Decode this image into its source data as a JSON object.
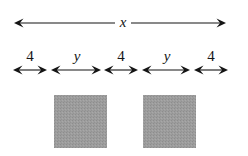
{
  "figure": {
    "canvas": {
      "width": 248,
      "height": 156,
      "background": "#ffffff"
    },
    "colors": {
      "ink": "#151515",
      "shade_fill": "#9a9a9a",
      "background": "#ffffff"
    },
    "overall_dimension": {
      "label": "x",
      "style": "italic",
      "arrow": "double-headed",
      "y": 23,
      "x_start": 14,
      "x_end": 226,
      "label_x": 123,
      "label_y": 27
    },
    "segments": [
      {
        "label": "4",
        "style": "upright",
        "x_start": 13,
        "x_end": 47,
        "label_x": 30,
        "label_y": 61,
        "arrow_y": 70,
        "shaded": false
      },
      {
        "label": "y",
        "style": "italic",
        "x_start": 51,
        "x_end": 101,
        "label_x": 77,
        "label_y": 61,
        "arrow_y": 70,
        "shaded": true
      },
      {
        "label": "4",
        "style": "upright",
        "x_start": 104,
        "x_end": 138,
        "label_x": 121,
        "label_y": 61,
        "arrow_y": 70,
        "shaded": false
      },
      {
        "label": "y",
        "style": "italic",
        "x_start": 142,
        "x_end": 190,
        "label_x": 167,
        "label_y": 61,
        "arrow_y": 70,
        "shaded": true
      },
      {
        "label": "4",
        "style": "upright",
        "x_start": 194,
        "x_end": 228,
        "label_x": 211,
        "label_y": 61,
        "arrow_y": 70,
        "shaded": false
      }
    ],
    "shaded_squares": [
      {
        "x": 54,
        "y": 95,
        "width": 53,
        "height": 53
      },
      {
        "x": 143,
        "y": 95,
        "width": 53,
        "height": 53
      }
    ]
  }
}
